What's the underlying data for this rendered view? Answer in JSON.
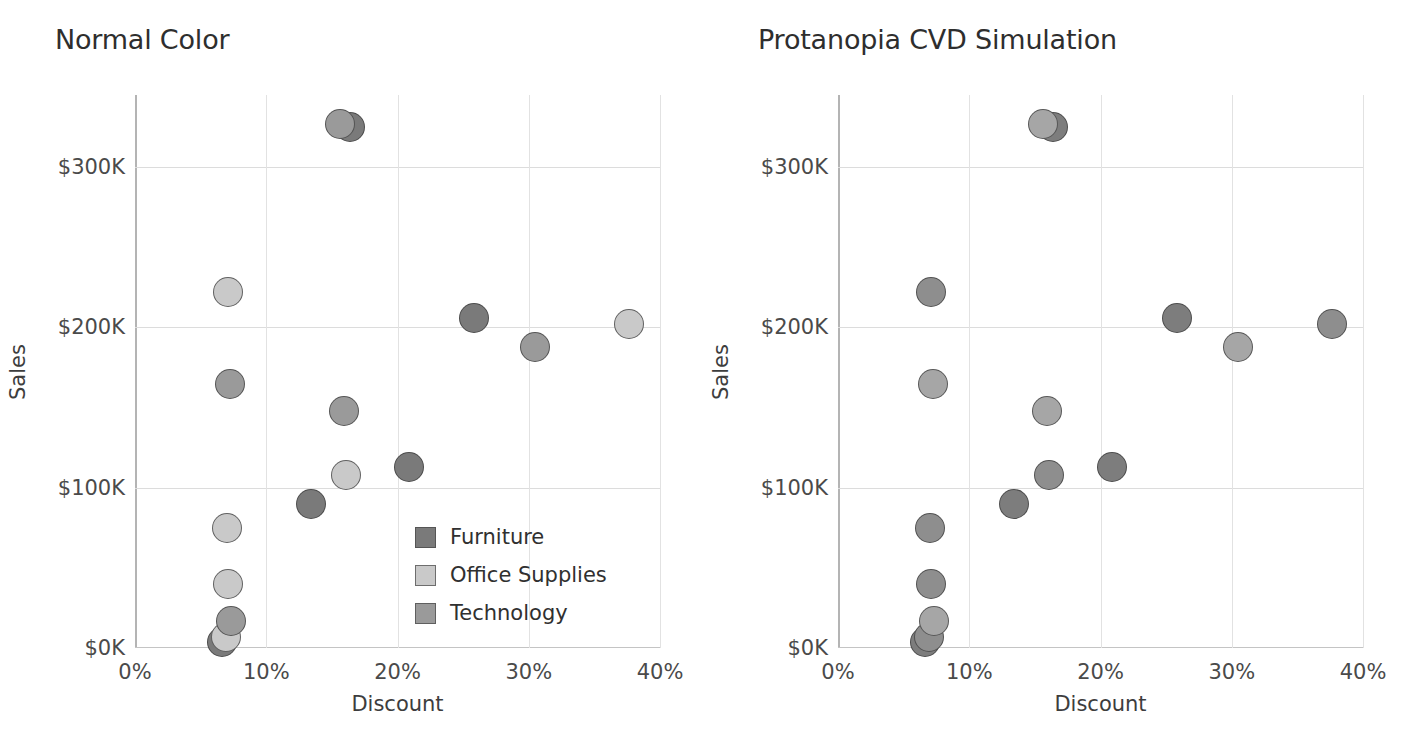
{
  "panels": [
    {
      "id": "normal",
      "title": "Normal Color",
      "xlabel": "Discount",
      "ylabel": "Sales"
    },
    {
      "id": "protanopia",
      "title": "Protanopia CVD Simulation",
      "xlabel": "Discount",
      "ylabel": "Sales"
    }
  ],
  "axes": {
    "x_ticks": [
      "0%",
      "10%",
      "20%",
      "30%",
      "40%"
    ],
    "y_ticks": [
      "$0K",
      "$100K",
      "$200K",
      "$300K"
    ]
  },
  "legend": {
    "items": [
      {
        "label": "Furniture",
        "normal_color": "#7a7a7a",
        "protanopia_color": "#7d7d7d"
      },
      {
        "label": "Office Supplies",
        "normal_color": "#c9c9c9",
        "protanopia_color": "#8e8e8e"
      },
      {
        "label": "Technology",
        "normal_color": "#9a9a9a",
        "protanopia_color": "#a6a6a6"
      }
    ]
  },
  "chart_data": {
    "type": "scatter",
    "xlabel": "Discount",
    "ylabel": "Sales",
    "xlim": [
      0,
      40
    ],
    "ylim": [
      0,
      345
    ],
    "x_ticks": [
      0,
      10,
      20,
      30,
      40
    ],
    "y_ticks": [
      0,
      100,
      200,
      300
    ],
    "x_unit": "percent",
    "y_unit": "thousand USD",
    "grid": true,
    "legend_position": "inside-bottom-right",
    "series": [
      {
        "name": "Furniture",
        "normal_color": "#7a7a7a",
        "protanopia_color": "#7d7d7d",
        "points": [
          {
            "x": 16.4,
            "y": 325
          },
          {
            "x": 25.8,
            "y": 206
          },
          {
            "x": 20.9,
            "y": 113
          },
          {
            "x": 13.4,
            "y": 90
          },
          {
            "x": 6.6,
            "y": 4
          }
        ]
      },
      {
        "name": "Office Supplies",
        "normal_color": "#c9c9c9",
        "protanopia_color": "#8e8e8e",
        "points": [
          {
            "x": 7.1,
            "y": 222
          },
          {
            "x": 37.6,
            "y": 202
          },
          {
            "x": 16.1,
            "y": 108
          },
          {
            "x": 7.0,
            "y": 75
          },
          {
            "x": 7.1,
            "y": 40
          },
          {
            "x": 6.9,
            "y": 7
          }
        ]
      },
      {
        "name": "Technology",
        "normal_color": "#9a9a9a",
        "protanopia_color": "#a6a6a6",
        "points": [
          {
            "x": 15.6,
            "y": 327
          },
          {
            "x": 30.5,
            "y": 188
          },
          {
            "x": 7.2,
            "y": 165
          },
          {
            "x": 15.9,
            "y": 148
          },
          {
            "x": 7.3,
            "y": 17
          }
        ]
      }
    ]
  }
}
